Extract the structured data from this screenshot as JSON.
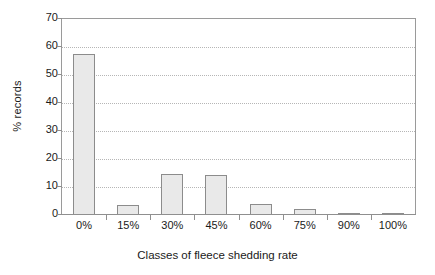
{
  "chart_data": {
    "type": "bar",
    "title": "",
    "xlabel": "Classes of fleece shedding rate",
    "ylabel": "% records",
    "categories": [
      "0%",
      "15%",
      "30%",
      "45%",
      "60%",
      "75%",
      "90%",
      "100%"
    ],
    "values": [
      57.5,
      3.7,
      14.6,
      14.2,
      4.1,
      2.3,
      0.4,
      0.6
    ],
    "ylim": [
      0,
      70
    ],
    "ytick_labels": [
      "0",
      "10",
      "20",
      "30",
      "40",
      "50",
      "60",
      "70"
    ],
    "ytick_values": [
      0,
      10,
      20,
      30,
      40,
      50,
      60,
      70
    ],
    "ytick_interval": 10,
    "grid": "horizontal-dotted",
    "legend": "none",
    "series": [
      {
        "name": "% records",
        "values": [
          57.5,
          3.7,
          14.6,
          14.2,
          4.1,
          2.3,
          0.4,
          0.6
        ]
      }
    ],
    "colors": {
      "bar_fill": "#e9e9e9",
      "bar_border": "#8c8c8c",
      "gridline": "#b6b6b6",
      "axis": "#8f8f8f",
      "text": "#1a1a1a",
      "background": "#ffffff"
    }
  }
}
